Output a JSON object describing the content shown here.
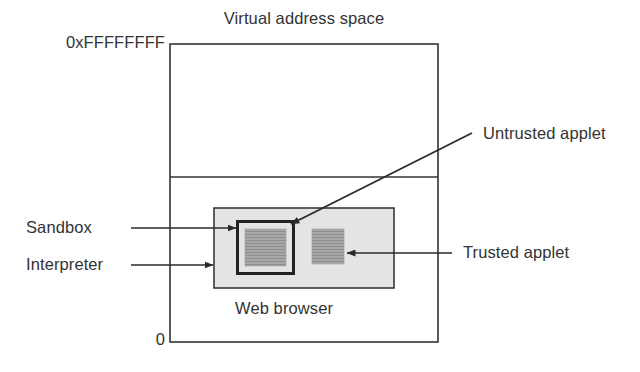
{
  "figure": {
    "type": "block-diagram",
    "title": "Virtual address space",
    "background_color": "#ffffff",
    "line_color": "#333333",
    "browser_fill": "#e4e4e4",
    "applet_fill": "#a8a8a8"
  },
  "labels": {
    "title": "Virtual address space",
    "address_top": "0xFFFFFFFF",
    "address_bottom": "0",
    "web_browser": "Web browser",
    "sandbox": "Sandbox",
    "interpreter": "Interpreter",
    "untrusted_applet": "Untrusted applet",
    "trusted_applet": "Trusted applet"
  },
  "boxes": [
    {
      "name": "virtual-address-space",
      "x": 170,
      "y": 44,
      "w": 268,
      "h": 298,
      "fill": "none",
      "stroke": "#333333",
      "stroke_width": 1.6
    },
    {
      "name": "web-browser",
      "x": 214,
      "y": 208,
      "w": 180,
      "h": 80,
      "fill": "#e4e4e4",
      "stroke": "#333333",
      "stroke_width": 1.6
    },
    {
      "name": "sandbox",
      "x": 237,
      "y": 221,
      "w": 57,
      "h": 53,
      "fill": "none",
      "stroke": "#222222",
      "stroke_width": 3
    },
    {
      "name": "untrusted-applet",
      "x": 245,
      "y": 229,
      "w": 41,
      "h": 37,
      "fill": "#a8a8a8",
      "stroke": "none",
      "stroke_width": 0
    },
    {
      "name": "trusted-applet",
      "x": 312,
      "y": 229,
      "w": 32,
      "h": 35,
      "fill": "#a8a8a8",
      "stroke": "none",
      "stroke_width": 0
    }
  ],
  "divider": {
    "name": "address-space-divider",
    "x1": 170,
    "y1": 177,
    "x2": 438,
    "y2": 177
  },
  "arrows": [
    {
      "name": "sandbox-arrow",
      "from_x": 131,
      "from_y": 228,
      "to_x": 236,
      "to_y": 228
    },
    {
      "name": "interpreter-arrow",
      "from_x": 131,
      "from_y": 265,
      "to_x": 213,
      "to_y": 265
    },
    {
      "name": "untrusted-applet-arrow",
      "from_x": 472,
      "from_y": 133,
      "to_x": 291,
      "to_y": 224
    },
    {
      "name": "trusted-applet-arrow",
      "from_x": 452,
      "from_y": 253,
      "to_x": 347,
      "to_y": 253
    }
  ],
  "label_positions": {
    "title": {
      "x": 304,
      "y": 18
    },
    "address_top": {
      "x": 165,
      "y": 34
    },
    "address_bottom": {
      "x": 165,
      "y": 331
    },
    "web_browser": {
      "x": 284,
      "y": 300
    },
    "sandbox": {
      "x": 26,
      "y": 219
    },
    "interpreter": {
      "x": 26,
      "y": 256
    },
    "untrusted_applet": {
      "x": 483,
      "y": 125
    },
    "trusted_applet": {
      "x": 463,
      "y": 244
    }
  }
}
